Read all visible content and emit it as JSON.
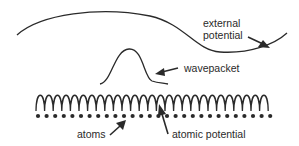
{
  "diagram": {
    "labels": {
      "external_potential_line1": "external",
      "external_potential_line2": "potential",
      "wavepacket": "wavepacket",
      "atoms": "atoms",
      "atomic_potential": "atomic potential"
    },
    "colors": {
      "stroke": "#2a2a2a",
      "background": "#ffffff"
    },
    "atomic_potential": {
      "x_start": 36,
      "x_end": 276,
      "top_y": 93,
      "bottom_y": 111,
      "period": 8.6
    },
    "atoms_row": {
      "y": 116,
      "x_start": 38,
      "x_end": 274,
      "spacing": 8.6,
      "radius": 2.1
    }
  }
}
